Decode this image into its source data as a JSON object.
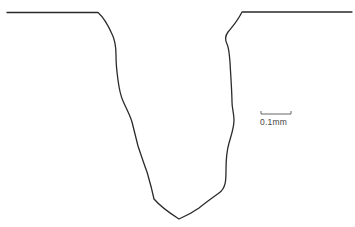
{
  "figure": {
    "line_color": "#2a2a2a",
    "background": "#ffffff"
  },
  "scale_bar": {
    "label": "0.1mm",
    "color": "#555555"
  }
}
